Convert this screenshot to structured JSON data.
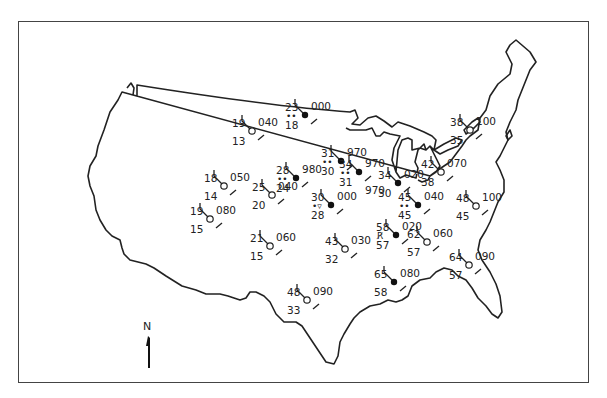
{
  "map": {
    "title": "",
    "north_arrow": {
      "label": "N",
      "x": 148,
      "y": 318
    },
    "colors": {
      "ink": "#222222",
      "background": "#ffffff",
      "frame": "#444444"
    }
  },
  "stations": [
    {
      "id": "s1",
      "x": 305,
      "y": 115,
      "temp": "23",
      "dew": "18",
      "pressure": "000",
      "weather": "••",
      "filled": true
    },
    {
      "id": "s2",
      "x": 252,
      "y": 131,
      "temp": "19",
      "dew": "13",
      "pressure": "040",
      "weather": "",
      "filled": false
    },
    {
      "id": "s3",
      "x": 341,
      "y": 161,
      "temp": "31",
      "dew": "30",
      "pressure": "970",
      "weather": "••",
      "filled": true
    },
    {
      "id": "s4",
      "x": 224,
      "y": 186,
      "temp": "18",
      "dew": "14",
      "pressure": "050",
      "weather": "",
      "filled": false
    },
    {
      "id": "s5",
      "x": 296,
      "y": 178,
      "temp": "28",
      "dew": "24",
      "pressure": "980",
      "weather": "••",
      "filled": true
    },
    {
      "id": "s6",
      "x": 359,
      "y": 172,
      "temp": "34",
      "dew": "31",
      "pressure": "970",
      "weather": "••",
      "pressure_below": "970",
      "filled": true
    },
    {
      "id": "s7",
      "x": 398,
      "y": 183,
      "temp": "34",
      "dew": "30",
      "pressure": "020",
      "weather": "",
      "filled": true
    },
    {
      "id": "s8",
      "x": 470,
      "y": 130,
      "temp": "38",
      "dew": "35",
      "pressure": "100",
      "weather": "",
      "filled": false
    },
    {
      "id": "s9",
      "x": 441,
      "y": 172,
      "temp": "42",
      "dew": "38",
      "pressure": "070",
      "weather": "",
      "filled": false
    },
    {
      "id": "s10",
      "x": 272,
      "y": 195,
      "temp": "25",
      "dew": "20",
      "pressure": "040",
      "weather": "",
      "filled": false
    },
    {
      "id": "s11",
      "x": 331,
      "y": 205,
      "temp": "30",
      "dew": "28",
      "pressure": "000",
      "weather": "snow-shower",
      "filled": true
    },
    {
      "id": "s12",
      "x": 418,
      "y": 205,
      "temp": "45",
      "dew": "45",
      "pressure": "040",
      "weather": "drizzle",
      "filled": true
    },
    {
      "id": "s13",
      "x": 476,
      "y": 206,
      "temp": "48",
      "dew": "45",
      "pressure": "100",
      "weather": "",
      "filled": false
    },
    {
      "id": "s14",
      "x": 210,
      "y": 219,
      "temp": "19",
      "dew": "15",
      "pressure": "080",
      "weather": "",
      "filled": false
    },
    {
      "id": "s15",
      "x": 396,
      "y": 235,
      "temp": "58",
      "dew": "57",
      "pressure": "020",
      "weather": "thunderstorm",
      "filled": true
    },
    {
      "id": "s16",
      "x": 270,
      "y": 246,
      "temp": "21",
      "dew": "15",
      "pressure": "060",
      "weather": "",
      "filled": false
    },
    {
      "id": "s17",
      "x": 427,
      "y": 242,
      "temp": "62",
      "dew": "57",
      "pressure": "060",
      "weather": "",
      "filled": false
    },
    {
      "id": "s18",
      "x": 345,
      "y": 249,
      "temp": "43",
      "dew": "32",
      "pressure": "030",
      "weather": "",
      "filled": false
    },
    {
      "id": "s19",
      "x": 469,
      "y": 265,
      "temp": "64",
      "dew": "57",
      "pressure": "090",
      "weather": "",
      "filled": false
    },
    {
      "id": "s20",
      "x": 394,
      "y": 282,
      "temp": "65",
      "dew": "58",
      "pressure": "080",
      "weather": "",
      "filled": true
    },
    {
      "id": "s21",
      "x": 307,
      "y": 300,
      "temp": "48",
      "dew": "33",
      "pressure": "090",
      "weather": "",
      "filled": false
    }
  ]
}
